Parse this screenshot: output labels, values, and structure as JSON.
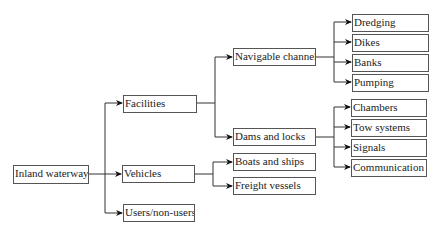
{
  "diagram": {
    "type": "tree",
    "root": "Inland waterways",
    "nodes": {
      "inland_waterways": "Inland waterways",
      "facilities": "Facilities",
      "vehicles": "Vehicles",
      "users": "Users/non-users",
      "navigable_channels": "Navigable channels",
      "dams_and_locks": "Dams and locks",
      "boats_and_ships": "Boats and ships",
      "freight_vessels": "Freight vessels",
      "dredging": "Dredging",
      "dikes": "Dikes",
      "banks": "Banks",
      "pumping": "Pumping",
      "chambers": "Chambers",
      "tow_systems": "Tow systems",
      "signals": "Signals",
      "communication": "Communication"
    },
    "edges": [
      [
        "Inland waterways",
        "Facilities"
      ],
      [
        "Inland waterways",
        "Vehicles"
      ],
      [
        "Inland waterways",
        "Users/non-users"
      ],
      [
        "Facilities",
        "Navigable channels"
      ],
      [
        "Facilities",
        "Dams and locks"
      ],
      [
        "Vehicles",
        "Boats and ships"
      ],
      [
        "Vehicles",
        "Freight vessels"
      ],
      [
        "Navigable channels",
        "Dredging"
      ],
      [
        "Navigable channels",
        "Dikes"
      ],
      [
        "Navigable channels",
        "Banks"
      ],
      [
        "Navigable channels",
        "Pumping"
      ],
      [
        "Dams and locks",
        "Chambers"
      ],
      [
        "Dams and locks",
        "Tow systems"
      ],
      [
        "Dams and locks",
        "Signals"
      ],
      [
        "Dams and locks",
        "Communication"
      ]
    ],
    "colors": {
      "line": "#333333",
      "border": "#555555",
      "text": "#222222"
    }
  }
}
